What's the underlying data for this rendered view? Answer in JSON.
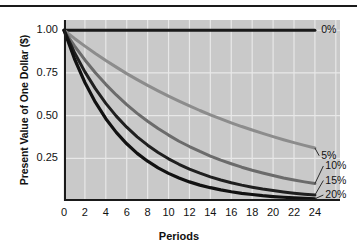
{
  "chart_data": {
    "type": "line",
    "title": "",
    "xlabel": "Periods",
    "ylabel": "Present Value of One Dollar ($)",
    "xlim": [
      0,
      26.4
    ],
    "ylim": [
      0,
      1.06
    ],
    "grid": true,
    "legend_position": "right-inline-labels",
    "x": [
      0,
      1,
      2,
      3,
      4,
      5,
      6,
      7,
      8,
      9,
      10,
      11,
      12,
      13,
      14,
      15,
      16,
      17,
      18,
      19,
      20,
      21,
      22,
      23,
      24
    ],
    "xticks": [
      "0",
      "2",
      "4",
      "6",
      "8",
      "10",
      "12",
      "14",
      "16",
      "18",
      "20",
      "22",
      "24"
    ],
    "xtick_values": [
      0,
      2,
      4,
      6,
      8,
      10,
      12,
      14,
      16,
      18,
      20,
      22,
      24
    ],
    "yticks": [
      "1.00",
      "0.75",
      "0.50",
      "0.25"
    ],
    "ytick_values": [
      1.0,
      0.75,
      0.5,
      0.25
    ],
    "series": [
      {
        "name": "0%",
        "rate": 0.0,
        "color": "#1a1a1a",
        "width": 3.0,
        "label_x": 24.6,
        "label_y": 1.0,
        "values": [
          1.0,
          1.0,
          1.0,
          1.0,
          1.0,
          1.0,
          1.0,
          1.0,
          1.0,
          1.0,
          1.0,
          1.0,
          1.0,
          1.0,
          1.0,
          1.0,
          1.0,
          1.0,
          1.0,
          1.0,
          1.0,
          1.0,
          1.0,
          1.0,
          1.0
        ]
      },
      {
        "name": "5%",
        "rate": 0.05,
        "color": "#8c8c8c",
        "width": 3.0,
        "label_x": 24.6,
        "label_y": 0.265,
        "values": [
          1.0,
          0.952,
          0.907,
          0.864,
          0.823,
          0.784,
          0.746,
          0.711,
          0.677,
          0.645,
          0.614,
          0.585,
          0.557,
          0.53,
          0.505,
          0.481,
          0.458,
          0.436,
          0.416,
          0.396,
          0.377,
          0.359,
          0.342,
          0.326,
          0.31
        ]
      },
      {
        "name": "10%",
        "rate": 0.1,
        "color": "#6b6b6b",
        "width": 3.0,
        "label_x": 25.0,
        "label_y": 0.205,
        "values": [
          1.0,
          0.909,
          0.826,
          0.751,
          0.683,
          0.621,
          0.564,
          0.513,
          0.467,
          0.424,
          0.386,
          0.35,
          0.319,
          0.29,
          0.263,
          0.239,
          0.218,
          0.198,
          0.18,
          0.164,
          0.149,
          0.135,
          0.123,
          0.112,
          0.102
        ]
      },
      {
        "name": "15%",
        "rate": 0.15,
        "color": "#1f1f1f",
        "width": 3.0,
        "label_x": 25.0,
        "label_y": 0.12,
        "values": [
          1.0,
          0.87,
          0.756,
          0.658,
          0.572,
          0.497,
          0.432,
          0.376,
          0.327,
          0.284,
          0.247,
          0.215,
          0.187,
          0.163,
          0.141,
          0.123,
          0.107,
          0.093,
          0.081,
          0.07,
          0.061,
          0.053,
          0.046,
          0.04,
          0.035
        ]
      },
      {
        "name": "20%",
        "rate": 0.2,
        "color": "#111111",
        "width": 3.2,
        "label_x": 25.0,
        "label_y": 0.035,
        "values": [
          1.0,
          0.833,
          0.694,
          0.579,
          0.482,
          0.402,
          0.335,
          0.279,
          0.233,
          0.194,
          0.162,
          0.135,
          0.112,
          0.093,
          0.078,
          0.065,
          0.054,
          0.045,
          0.038,
          0.031,
          0.026,
          0.022,
          0.018,
          0.015,
          0.013
        ]
      }
    ],
    "colors": {
      "plot_background": "#c9c9c9",
      "grid": "#e8e8e8",
      "axis": "#1a1a1a",
      "text": "#111111",
      "page_background": "#ffffff"
    }
  }
}
